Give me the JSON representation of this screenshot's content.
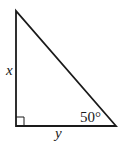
{
  "diagram": {
    "type": "right-triangle",
    "labels": {
      "vertical_leg": "x",
      "horizontal_leg": "y",
      "angle": "50°"
    },
    "right_angle_marker": true,
    "vertices": {
      "top": [
        16,
        11
      ],
      "bottom_left": [
        16,
        126
      ],
      "bottom_right": [
        116,
        126
      ]
    },
    "colors": {
      "stroke": "#1a1a1a",
      "background": "#ffffff"
    }
  }
}
